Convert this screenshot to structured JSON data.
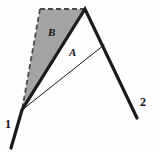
{
  "figure": {
    "background_color": "#fefefe",
    "stroke_color": "#1a1a1a",
    "shade_fill_color": "#a3a3a3",
    "shade_edge_color": "#555555",
    "width": 157,
    "height": 153,
    "labels": {
      "region_shaded": "B",
      "region_inner": "A",
      "vertex_left": "1",
      "vertex_right": "2"
    },
    "points": {
      "vertex1": [
        22,
        110
      ],
      "apex": [
        85,
        9
      ],
      "dash_corner": [
        40,
        9
      ],
      "junction": [
        104,
        45
      ],
      "lower_right_end": [
        137,
        118
      ],
      "lower_left_end": [
        11,
        148
      ]
    },
    "geometry": {
      "thick_polyline": "11,148 22,110 85,9 137,118",
      "thin_line": "22,110 104,45",
      "shaded_triangle": "22,110 40,9 85,9",
      "dashed_edges": "40,9 85,9 and 22,110 40,9"
    }
  }
}
